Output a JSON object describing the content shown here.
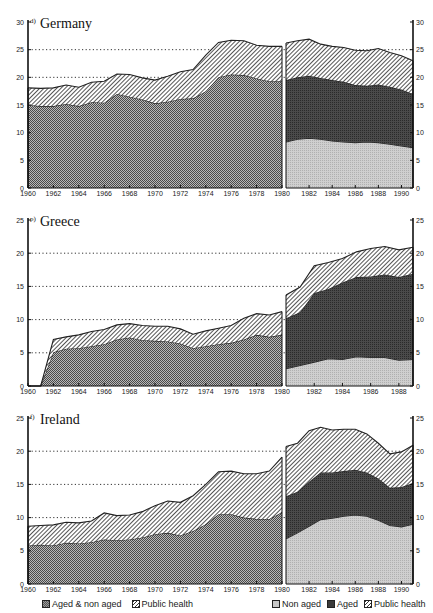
{
  "chart_data": [
    {
      "type": "area",
      "title": "Germany",
      "footnote_marker": "d)",
      "ylim": [
        0,
        30
      ],
      "yticks": [
        0,
        5,
        10,
        15,
        20,
        25,
        30
      ],
      "gridlines": [
        20,
        25
      ],
      "left_panel": {
        "x": [
          1960,
          1961,
          1962,
          1963,
          1964,
          1965,
          1966,
          1967,
          1968,
          1969,
          1970,
          1971,
          1972,
          1973,
          1974,
          1975,
          1976,
          1977,
          1978,
          1979,
          1980
        ],
        "xticks": [
          1960,
          1962,
          1964,
          1966,
          1968,
          1970,
          1972,
          1974,
          1976,
          1978,
          1980
        ],
        "series": [
          {
            "name": "Aged & non aged",
            "values": [
              15.0,
              14.8,
              14.8,
              15.2,
              14.8,
              15.5,
              15.4,
              17.0,
              16.5,
              16.0,
              15.3,
              15.6,
              16.1,
              16.2,
              17.5,
              20.0,
              20.5,
              20.4,
              19.8,
              19.3,
              19.3
            ]
          },
          {
            "name": "Public health",
            "values": [
              3.1,
              3.2,
              3.3,
              3.4,
              3.4,
              3.6,
              3.9,
              3.6,
              4.0,
              3.9,
              4.2,
              4.6,
              4.9,
              5.2,
              6.5,
              6.3,
              6.2,
              6.2,
              6.0,
              6.3,
              6.3
            ]
          }
        ]
      },
      "right_panel": {
        "x": [
          1980,
          1981,
          1982,
          1983,
          1984,
          1985,
          1986,
          1987,
          1988,
          1989,
          1990,
          1991
        ],
        "xticks": [
          1982,
          1984,
          1986,
          1988,
          1990
        ],
        "series": [
          {
            "name": "Non aged",
            "values": [
              8.3,
              8.8,
              9.0,
              8.8,
              8.5,
              8.3,
              8.2,
              8.3,
              8.2,
              7.9,
              7.6,
              7.3
            ]
          },
          {
            "name": "Aged",
            "values": [
              11.2,
              11.2,
              11.3,
              11.1,
              11.0,
              10.9,
              10.4,
              10.2,
              10.5,
              10.4,
              10.2,
              9.7
            ]
          },
          {
            "name": "Public health",
            "values": [
              6.7,
              6.6,
              6.6,
              6.1,
              6.1,
              6.2,
              6.3,
              6.3,
              6.5,
              6.2,
              6.1,
              6.0
            ]
          }
        ]
      }
    },
    {
      "type": "area",
      "title": "Greece",
      "footnote_marker": "p)",
      "ylim": [
        0,
        25
      ],
      "yticks": [
        0,
        5,
        10,
        15,
        20,
        25
      ],
      "gridlines": [
        5,
        10,
        15,
        20
      ],
      "left_panel": {
        "x": [
          1960,
          1961,
          1962,
          1963,
          1964,
          1965,
          1966,
          1967,
          1968,
          1969,
          1970,
          1971,
          1972,
          1973,
          1974,
          1975,
          1976,
          1977,
          1978,
          1979,
          1980
        ],
        "xticks": [
          1960,
          1962,
          1964,
          1966,
          1968,
          1970,
          1972,
          1974,
          1976,
          1978,
          1980
        ],
        "series": [
          {
            "name": "Aged & non aged",
            "values": [
              0,
              0,
              5.1,
              5.6,
              5.7,
              6.0,
              6.3,
              7.0,
              7.3,
              6.9,
              6.8,
              6.7,
              6.4,
              5.7,
              6.0,
              6.3,
              6.5,
              7.0,
              7.7,
              7.4,
              7.7
            ]
          },
          {
            "name": "Public health",
            "values": [
              0,
              0,
              1.9,
              1.8,
              2.0,
              2.2,
              2.2,
              2.2,
              2.1,
              2.2,
              2.2,
              2.3,
              2.2,
              2.1,
              2.3,
              2.4,
              2.6,
              3.2,
              3.2,
              3.3,
              3.5
            ]
          }
        ]
      },
      "right_panel": {
        "x": [
          1980,
          1981,
          1982,
          1983,
          1984,
          1985,
          1986,
          1987,
          1988,
          1989
        ],
        "xticks": [
          1982,
          1984,
          1986,
          1988
        ],
        "series": [
          {
            "name": "Non aged",
            "values": [
              2.6,
              3.1,
              3.6,
              4.1,
              4.0,
              4.4,
              4.3,
              4.3,
              3.9,
              4.0
            ]
          },
          {
            "name": "Aged",
            "values": [
              7.6,
              8.0,
              10.4,
              10.5,
              11.6,
              12.0,
              12.2,
              12.5,
              12.5,
              12.9
            ]
          },
          {
            "name": "Public health",
            "values": [
              3.5,
              3.8,
              4.1,
              4.0,
              3.6,
              3.8,
              4.2,
              4.2,
              4.1,
              4.0
            ]
          }
        ]
      }
    },
    {
      "type": "area",
      "title": "Ireland",
      "footnote_marker": "f)",
      "ylim": [
        0,
        25
      ],
      "yticks": [
        0,
        5,
        10,
        15,
        20,
        25
      ],
      "gridlines": [
        10,
        15,
        20
      ],
      "left_panel": {
        "x": [
          1960,
          1961,
          1962,
          1963,
          1964,
          1965,
          1966,
          1967,
          1968,
          1969,
          1970,
          1971,
          1972,
          1973,
          1974,
          1975,
          1976,
          1977,
          1978,
          1979,
          1980
        ],
        "xticks": [
          1960,
          1962,
          1964,
          1966,
          1968,
          1970,
          1972,
          1974,
          1976,
          1978,
          1980
        ],
        "series": [
          {
            "name": "Aged & non aged",
            "values": [
              5.8,
              5.9,
              5.8,
              6.2,
              6.1,
              6.3,
              6.7,
              6.6,
              6.7,
              7.0,
              7.5,
              7.7,
              7.3,
              8.0,
              9.0,
              10.5,
              10.5,
              10.0,
              9.8,
              9.8,
              10.8
            ]
          },
          {
            "name": "Public health",
            "values": [
              2.9,
              2.9,
              3.1,
              3.1,
              3.1,
              3.2,
              4.0,
              3.7,
              3.7,
              3.9,
              4.3,
              4.8,
              5.0,
              5.3,
              6.0,
              6.4,
              6.5,
              6.6,
              6.8,
              7.2,
              8.3
            ]
          }
        ]
      },
      "right_panel": {
        "x": [
          1980,
          1981,
          1982,
          1983,
          1984,
          1985,
          1986,
          1987,
          1988,
          1989,
          1990,
          1991
        ],
        "xticks": [
          1982,
          1984,
          1986,
          1988,
          1990
        ],
        "series": [
          {
            "name": "Non aged",
            "values": [
              6.8,
              7.7,
              8.7,
              9.7,
              9.9,
              10.2,
              10.4,
              10.2,
              9.6,
              8.8,
              8.6,
              9.0
            ]
          },
          {
            "name": "Aged",
            "values": [
              6.4,
              6.2,
              6.7,
              7.1,
              6.9,
              6.8,
              6.8,
              6.6,
              6.3,
              5.7,
              6.0,
              6.2
            ]
          },
          {
            "name": "Public health",
            "values": [
              7.5,
              7.3,
              7.7,
              6.8,
              6.4,
              6.3,
              6.1,
              5.8,
              5.3,
              5.1,
              5.3,
              5.7
            ]
          }
        ]
      }
    }
  ],
  "legend": {
    "left": [
      {
        "label": "Aged & non aged",
        "pattern": "combined"
      },
      {
        "label": "Public health",
        "pattern": "health"
      }
    ],
    "right": [
      {
        "label": "Non aged",
        "pattern": "nonaged"
      },
      {
        "label": "Aged",
        "pattern": "aged"
      },
      {
        "label": "Public health",
        "pattern": "health"
      }
    ]
  },
  "colors": {
    "combined": "#8c8c8c",
    "nonaged": "#c4c4c4",
    "aged": "#3c3c3c",
    "health_line": "#333333",
    "axis": "#111111"
  }
}
